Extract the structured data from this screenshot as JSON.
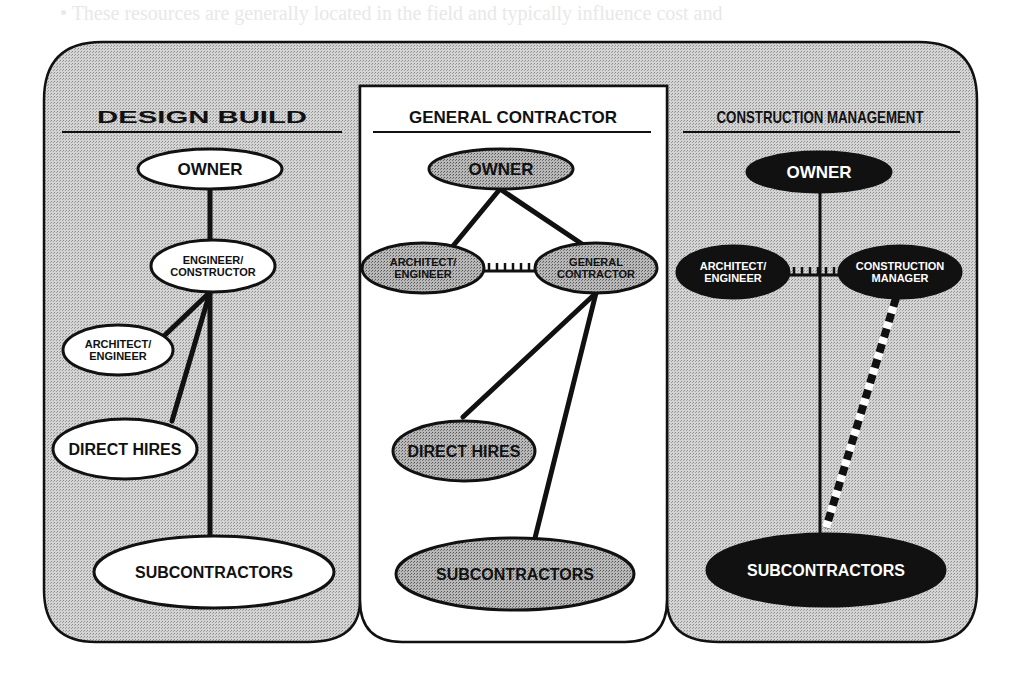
{
  "colors": {
    "panel_shade": "#c9c9c9",
    "panel_white": "#ffffff",
    "stroke": "#111111",
    "node_white": "#ffffff",
    "node_gray": "#b0b0b0",
    "node_black": "#111111"
  },
  "panels": [
    {
      "id": "design-build",
      "title": "DESIGN BUILD",
      "nodes": [
        {
          "id": "db-owner",
          "lines": [
            "OWNER"
          ],
          "cx": 210,
          "cy": 169,
          "rx": 72,
          "ry": 20,
          "fill": "white",
          "size": 17
        },
        {
          "id": "db-engineer-constructor",
          "lines": [
            "ENGINEER/",
            "CONSTRUCTOR"
          ],
          "cx": 213,
          "cy": 266,
          "rx": 62,
          "ry": 26,
          "fill": "white",
          "size": 11
        },
        {
          "id": "db-architect-engineer",
          "lines": [
            "ARCHITECT/",
            "ENGINEER"
          ],
          "cx": 118,
          "cy": 350,
          "rx": 55,
          "ry": 25,
          "fill": "white",
          "size": 11
        },
        {
          "id": "db-direct-hires",
          "lines": [
            "DIRECT HIRES"
          ],
          "cx": 125,
          "cy": 449,
          "rx": 72,
          "ry": 30,
          "fill": "white",
          "size": 16
        },
        {
          "id": "db-subcontractors",
          "lines": [
            "SUBCONTRACTORS"
          ],
          "cx": 214,
          "cy": 572,
          "rx": 120,
          "ry": 36,
          "fill": "white",
          "size": 16
        }
      ]
    },
    {
      "id": "general-contractor",
      "title": "GENERAL CONTRACTOR",
      "nodes": [
        {
          "id": "gc-owner",
          "lines": [
            "OWNER"
          ],
          "cx": 501,
          "cy": 169,
          "rx": 72,
          "ry": 20,
          "fill": "gray",
          "size": 17
        },
        {
          "id": "gc-architect-engineer",
          "lines": [
            "ARCHITECT/",
            "ENGINEER"
          ],
          "cx": 423,
          "cy": 268,
          "rx": 61,
          "ry": 25,
          "fill": "gray",
          "size": 11
        },
        {
          "id": "gc-general-contractor",
          "lines": [
            "GENERAL",
            "CONTRACTOR"
          ],
          "cx": 596,
          "cy": 268,
          "rx": 61,
          "ry": 25,
          "fill": "gray",
          "size": 11
        },
        {
          "id": "gc-direct-hires",
          "lines": [
            "DIRECT HIRES"
          ],
          "cx": 464,
          "cy": 451,
          "rx": 71,
          "ry": 30,
          "fill": "gray",
          "size": 16
        },
        {
          "id": "gc-subcontractors",
          "lines": [
            "SUBCONTRACTORS"
          ],
          "cx": 515,
          "cy": 574,
          "rx": 119,
          "ry": 36,
          "fill": "gray",
          "size": 16
        }
      ]
    },
    {
      "id": "construction-management",
      "title": "CONSTRUCTION MANAGEMENT",
      "nodes": [
        {
          "id": "cm-owner",
          "lines": [
            "OWNER"
          ],
          "cx": 819,
          "cy": 172,
          "rx": 72,
          "ry": 20,
          "fill": "black",
          "size": 17
        },
        {
          "id": "cm-architect-engineer",
          "lines": [
            "ARCHITECT/",
            "ENGINEER"
          ],
          "cx": 733,
          "cy": 272,
          "rx": 56,
          "ry": 26,
          "fill": "black",
          "size": 11
        },
        {
          "id": "cm-construction-manager",
          "lines": [
            "CONSTRUCTION",
            "MANAGER"
          ],
          "cx": 900,
          "cy": 272,
          "rx": 61,
          "ry": 26,
          "fill": "black",
          "size": 11
        },
        {
          "id": "cm-subcontractors",
          "lines": [
            "SUBCONTRACTORS"
          ],
          "cx": 826,
          "cy": 570,
          "rx": 119,
          "ry": 36,
          "fill": "black",
          "size": 16
        }
      ]
    }
  ],
  "edges": [
    {
      "from": "db-owner",
      "to": "db-engineer-constructor",
      "style": "solid",
      "pts": [
        210,
        189,
        210,
        240
      ]
    },
    {
      "from": "db-engineer-constructor",
      "to": "db-architect-engineer",
      "style": "solid",
      "pts": [
        210,
        292,
        164,
        336
      ]
    },
    {
      "from": "db-engineer-constructor",
      "to": "db-direct-hires",
      "style": "solid",
      "pts": [
        210,
        292,
        172,
        421
      ]
    },
    {
      "from": "db-engineer-constructor",
      "to": "db-subcontractors",
      "style": "solid",
      "pts": [
        210,
        292,
        210,
        536
      ]
    },
    {
      "from": "gc-owner",
      "to": "gc-architect-engineer",
      "style": "solid",
      "pts": [
        500,
        189,
        453,
        246
      ]
    },
    {
      "from": "gc-owner",
      "to": "gc-general-contractor",
      "style": "solid",
      "pts": [
        500,
        189,
        582,
        244
      ]
    },
    {
      "from": "gc-architect-engineer",
      "to": "gc-general-contractor",
      "style": "contractual-ticks",
      "pts": [
        484,
        268,
        535,
        268
      ]
    },
    {
      "from": "gc-general-contractor",
      "to": "gc-direct-hires",
      "style": "solid",
      "pts": [
        596,
        293,
        463,
        417
      ]
    },
    {
      "from": "gc-general-contractor",
      "to": "gc-subcontractors",
      "style": "solid",
      "pts": [
        596,
        293,
        535,
        538
      ]
    },
    {
      "from": "cm-owner",
      "to": "cm-subcontractors",
      "style": "thin-solid",
      "pts": [
        820,
        192,
        820,
        534
      ]
    },
    {
      "from": "cm-architect-engineer",
      "to": "cm-construction-manager",
      "style": "contractual-ticks",
      "pts": [
        789,
        272,
        839,
        272
      ]
    },
    {
      "from": "cm-construction-manager",
      "to": "cm-subcontractors",
      "style": "dashed-bw",
      "pts": [
        896,
        298,
        826,
        528
      ]
    }
  ],
  "ghost_text": [
    {
      "text": "•   These resources are generally located in the field and typically influence cost and",
      "y": -6
    },
    {
      "text": "",
      "y": 0
    }
  ]
}
